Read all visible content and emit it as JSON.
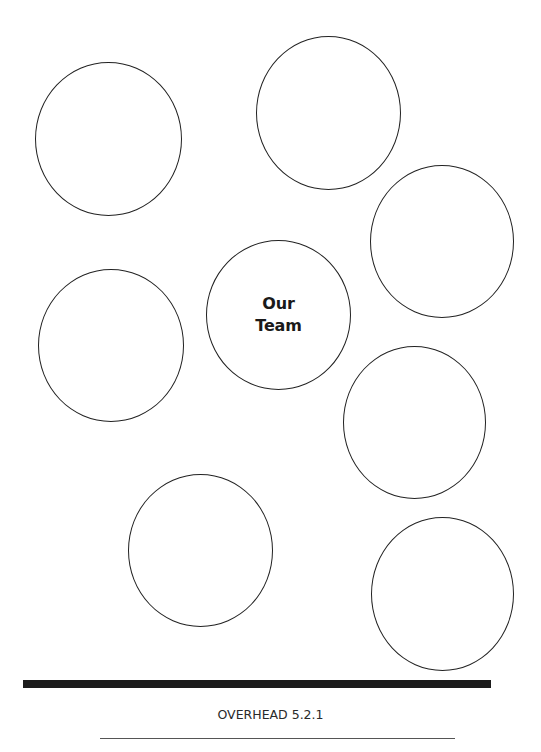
{
  "diagram": {
    "center": {
      "label_line1": "Our",
      "label_line2": "Team"
    },
    "outer_circles": [
      {
        "label": ""
      },
      {
        "label": ""
      },
      {
        "label": ""
      },
      {
        "label": ""
      },
      {
        "label": ""
      },
      {
        "label": ""
      },
      {
        "label": ""
      }
    ]
  },
  "footer": {
    "label": "OVERHEAD 5.2.1"
  },
  "colors": {
    "stroke": "#222222",
    "bar": "#1c1c1c",
    "background": "#ffffff"
  }
}
